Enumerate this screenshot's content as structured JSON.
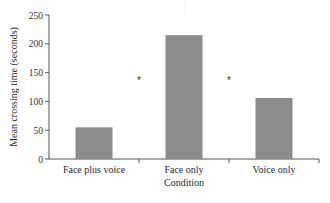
{
  "chart_data": {
    "type": "bar",
    "title": "",
    "xlabel": "Condition",
    "ylabel": "Mean crossing time (seconds)",
    "categories": [
      "Face plus voice",
      "Face only",
      "Voice only"
    ],
    "values": [
      55,
      215,
      106
    ],
    "ylim": [
      0,
      250
    ],
    "yticks": [
      0,
      50,
      100,
      150,
      200,
      250
    ],
    "grid": false,
    "legend": null,
    "annotations": [
      {
        "text": "*",
        "between": [
          "Face plus voice",
          "Face only"
        ]
      },
      {
        "text": "*",
        "between": [
          "Face only",
          "Voice only"
        ]
      }
    ],
    "bar_color": "#8c8c8c"
  }
}
